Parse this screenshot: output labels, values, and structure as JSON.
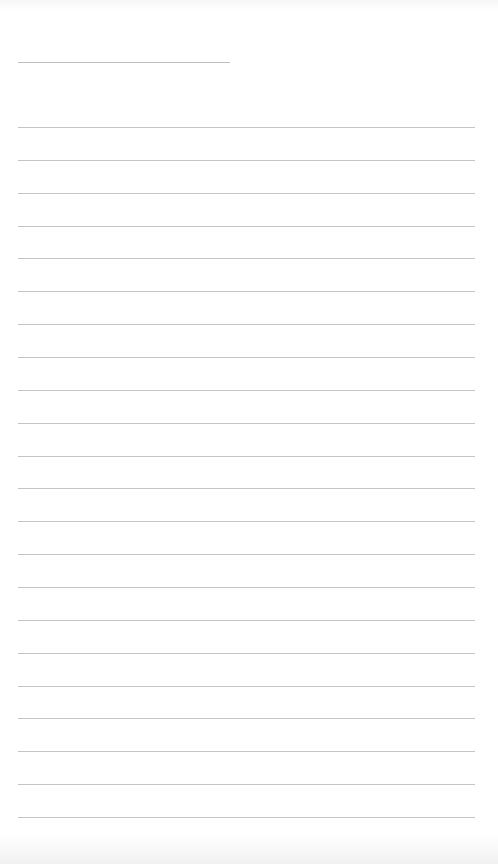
{
  "page": {
    "type": "lined-notepaper",
    "background_color": "#ffffff",
    "line_color": "#c4c4c4",
    "title_line": {
      "text": "",
      "left": 18,
      "top": 62,
      "width": 212
    },
    "ruled_lines": {
      "count": 22,
      "left": 18,
      "width": 457,
      "first_top": 127,
      "spacing": 32.86,
      "entries": [
        "",
        "",
        "",
        "",
        "",
        "",
        "",
        "",
        "",
        "",
        "",
        "",
        "",
        "",
        "",
        "",
        "",
        "",
        "",
        "",
        "",
        ""
      ]
    }
  }
}
